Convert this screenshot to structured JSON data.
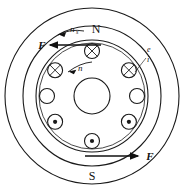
{
  "figure": {
    "canvas": {
      "width": 184,
      "height": 193,
      "background": "#ffffff"
    },
    "line_color": "#1a1a1a"
  },
  "labels": {
    "pole_north": "N",
    "pole_south": "S",
    "force_top": "F",
    "force_bottom": "F",
    "sync_speed": "n",
    "sync_speed_sub": "s",
    "rotor_speed": "n",
    "emf": "e",
    "current": "i"
  },
  "geometry": {
    "center_x": 92,
    "center_y": 96,
    "stator_outer_radius": 88,
    "stator_inner_radius": 70,
    "rotor_outer_radius": 56,
    "rotor_inner_radius": 53,
    "shaft_radius": 18,
    "conductor_ring_radius": 45,
    "conductor_radius": 7.5
  },
  "conductors": [
    {
      "name": "conductor-top",
      "angle_deg": -90,
      "marking": "cross"
    },
    {
      "name": "conductor-upper-left",
      "angle_deg": -145,
      "marking": "cross"
    },
    {
      "name": "conductor-upper-right",
      "angle_deg": -35,
      "marking": "cross"
    },
    {
      "name": "conductor-left",
      "angle_deg": 180,
      "marking": "plain"
    },
    {
      "name": "conductor-right",
      "angle_deg": 0,
      "marking": "plain"
    },
    {
      "name": "conductor-lower-left",
      "angle_deg": 145,
      "marking": "dot"
    },
    {
      "name": "conductor-lower-right",
      "angle_deg": 35,
      "marking": "dot"
    },
    {
      "name": "conductor-bottom",
      "angle_deg": 90,
      "marking": "dot"
    }
  ],
  "legend_meaning": {
    "cross": "current into page",
    "dot": "current out of page"
  }
}
